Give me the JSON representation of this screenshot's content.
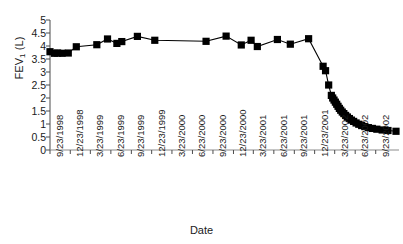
{
  "chart_data": {
    "type": "scatter",
    "title": "",
    "xlabel": "Date",
    "ylabel": "FEV1 (L)",
    "ylabel_text": "FEV",
    "ylabel_sub": "1",
    "ylabel_unit": " (L)",
    "ylim": [
      0,
      5
    ],
    "yticks": [
      "0",
      "0.5",
      "1",
      "1.5",
      "2",
      "2.5",
      "3",
      "3.5",
      "4",
      "4.5",
      "5"
    ],
    "ytick_values": [
      0,
      0.5,
      1,
      1.5,
      2,
      2.5,
      3,
      3.5,
      4,
      4.5,
      5
    ],
    "xticks": [
      "9/23/1998",
      "12/23/1998",
      "3/23/1999",
      "6/23/1999",
      "9/23/1999",
      "12/23/1999",
      "3/23/2000",
      "6/23/2000",
      "9/23/2000",
      "12/23/2000",
      "3/23/2001",
      "6/23/2001",
      "9/23/2001",
      "12/23/2001",
      "3/23/2002",
      "6/23/2002",
      "9/23/2002"
    ],
    "xlim_days": [
      0,
      1552
    ],
    "xtick_days": [
      0,
      91,
      181,
      273,
      365,
      456,
      547,
      639,
      731,
      823,
      912,
      1004,
      1096,
      1187,
      1277,
      1369,
      1461
    ],
    "grid": false,
    "legend": null,
    "marker": "square",
    "marker_color": "#000000",
    "line_color": "#000000",
    "series": [
      {
        "name": "FEV1",
        "points": [
          {
            "x_days": 0,
            "date": "9/23/1998",
            "y": 3.78
          },
          {
            "x_days": 20,
            "date": "10/13/1998",
            "y": 3.72
          },
          {
            "x_days": 34,
            "date": "10/27/1998",
            "y": 3.73
          },
          {
            "x_days": 54,
            "date": "11/16/1998",
            "y": 3.72
          },
          {
            "x_days": 82,
            "date": "12/14/1998",
            "y": 3.73
          },
          {
            "x_days": 118,
            "date": "1/19/1999",
            "y": 3.97
          },
          {
            "x_days": 210,
            "date": "4/21/1999",
            "y": 4.05
          },
          {
            "x_days": 258,
            "date": "6/8/1999",
            "y": 4.27
          },
          {
            "x_days": 300,
            "date": "7/20/1999",
            "y": 4.1
          },
          {
            "x_days": 322,
            "date": "8/11/1999",
            "y": 4.17
          },
          {
            "x_days": 392,
            "date": "10/20/1999",
            "y": 4.37
          },
          {
            "x_days": 470,
            "date": "1/6/2000",
            "y": 4.22
          },
          {
            "x_days": 700,
            "date": "8/23/2000",
            "y": 4.18
          },
          {
            "x_days": 790,
            "date": "11/21/2000",
            "y": 4.38
          },
          {
            "x_days": 858,
            "date": "1/28/2001",
            "y": 4.04
          },
          {
            "x_days": 902,
            "date": "3/13/2001",
            "y": 4.22
          },
          {
            "x_days": 930,
            "date": "4/10/2001",
            "y": 3.98
          },
          {
            "x_days": 1020,
            "date": "7/9/2001",
            "y": 4.25
          },
          {
            "x_days": 1078,
            "date": "9/5/2001",
            "y": 4.07
          },
          {
            "x_days": 1160,
            "date": "11/26/2001",
            "y": 4.28
          },
          {
            "x_days": 1225,
            "date": "1/30/2002",
            "y": 3.22
          },
          {
            "x_days": 1236,
            "date": "2/10/2002",
            "y": 3.05
          },
          {
            "x_days": 1250,
            "date": "2/24/2002",
            "y": 2.5
          },
          {
            "x_days": 1262,
            "date": "3/8/2002",
            "y": 2.1
          },
          {
            "x_days": 1268,
            "date": "3/14/2002",
            "y": 2.0
          },
          {
            "x_days": 1274,
            "date": "3/20/2002",
            "y": 1.92
          },
          {
            "x_days": 1280,
            "date": "3/26/2002",
            "y": 1.84
          },
          {
            "x_days": 1286,
            "date": "4/1/2002",
            "y": 1.76
          },
          {
            "x_days": 1292,
            "date": "4/7/2002",
            "y": 1.68
          },
          {
            "x_days": 1298,
            "date": "4/13/2002",
            "y": 1.6
          },
          {
            "x_days": 1304,
            "date": "4/19/2002",
            "y": 1.53
          },
          {
            "x_days": 1311,
            "date": "4/26/2002",
            "y": 1.46
          },
          {
            "x_days": 1318,
            "date": "5/3/2002",
            "y": 1.4
          },
          {
            "x_days": 1326,
            "date": "5/11/2002",
            "y": 1.33
          },
          {
            "x_days": 1334,
            "date": "5/19/2002",
            "y": 1.27
          },
          {
            "x_days": 1343,
            "date": "5/28/2002",
            "y": 1.21
          },
          {
            "x_days": 1352,
            "date": "6/6/2002",
            "y": 1.15
          },
          {
            "x_days": 1362,
            "date": "6/16/2002",
            "y": 1.1
          },
          {
            "x_days": 1373,
            "date": "6/27/2002",
            "y": 1.04
          },
          {
            "x_days": 1385,
            "date": "7/9/2002",
            "y": 0.99
          },
          {
            "x_days": 1398,
            "date": "7/22/2002",
            "y": 0.94
          },
          {
            "x_days": 1412,
            "date": "8/5/2002",
            "y": 0.9
          },
          {
            "x_days": 1428,
            "date": "8/21/2002",
            "y": 0.86
          },
          {
            "x_days": 1446,
            "date": "9/8/2002",
            "y": 0.83
          },
          {
            "x_days": 1466,
            "date": "9/28/2002",
            "y": 0.8
          },
          {
            "x_days": 1490,
            "date": "10/22/2002",
            "y": 0.77
          },
          {
            "x_days": 1516,
            "date": "11/17/2002",
            "y": 0.75
          },
          {
            "x_days": 1552,
            "date": "12/23/2002",
            "y": 0.72
          }
        ]
      }
    ]
  }
}
